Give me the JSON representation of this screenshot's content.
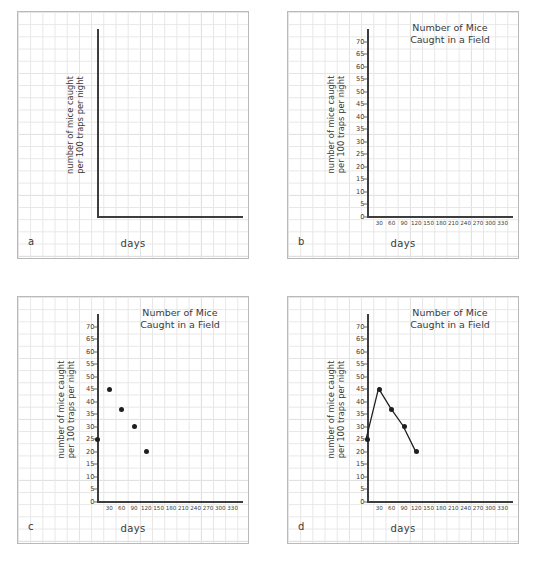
{
  "figure": {
    "panels": [
      {
        "letter": "a",
        "name": "panel-a",
        "title": "",
        "has_title": false,
        "has_ticks": false,
        "xlabel": "days",
        "ylabel": "number of mice caught\nper 100 traps per night",
        "plot_type": "axes-only"
      },
      {
        "letter": "b",
        "name": "panel-b",
        "title": "Number of Mice\nCaught in a Field",
        "has_title": true,
        "has_ticks": true,
        "xlabel": "days",
        "ylabel": "number of mice caught\nper 100 traps per night",
        "plot_type": "empty-axes-scaled"
      },
      {
        "letter": "c",
        "name": "panel-c",
        "title": "Number of Mice\nCaught in a Field",
        "has_title": true,
        "has_ticks": true,
        "xlabel": "days",
        "ylabel": "number of mice caught\nper 100 traps per night",
        "plot_type": "scatter"
      },
      {
        "letter": "d",
        "name": "panel-d",
        "title": "Number of Mice\nCaught in a Field",
        "has_title": true,
        "has_ticks": true,
        "xlabel": "days",
        "ylabel": "number of mice caught\nper 100 traps per night",
        "plot_type": "line"
      }
    ],
    "yticks": [
      0,
      5,
      10,
      15,
      20,
      25,
      30,
      35,
      40,
      45,
      50,
      55,
      60,
      65,
      70
    ],
    "xticks": [
      30,
      60,
      90,
      120,
      150,
      180,
      210,
      240,
      270,
      300,
      330
    ]
  },
  "chart_data": [
    {
      "type": "scatter",
      "panel": "c",
      "title": "Number of Mice Caught in a Field",
      "xlabel": "days",
      "ylabel": "number of mice caught per 100 traps per night",
      "x": [
        0,
        30,
        60,
        90,
        120
      ],
      "values": [
        25,
        45,
        37,
        30,
        20
      ],
      "xlim": [
        0,
        360
      ],
      "ylim": [
        0,
        75
      ],
      "xticks": [
        30,
        60,
        90,
        120,
        150,
        180,
        210,
        240,
        270,
        300,
        330
      ],
      "yticks": [
        0,
        5,
        10,
        15,
        20,
        25,
        30,
        35,
        40,
        45,
        50,
        55,
        60,
        65,
        70
      ],
      "grid": true,
      "legend": "none"
    },
    {
      "type": "line",
      "panel": "d",
      "title": "Number of Mice Caught in a Field",
      "xlabel": "days",
      "ylabel": "number of mice caught per 100 traps per night",
      "x": [
        0,
        30,
        60,
        90,
        120
      ],
      "values": [
        25,
        45,
        37,
        30,
        20
      ],
      "xlim": [
        0,
        360
      ],
      "ylim": [
        0,
        75
      ],
      "xticks": [
        30,
        60,
        90,
        120,
        150,
        180,
        210,
        240,
        270,
        300,
        330
      ],
      "yticks": [
        0,
        5,
        10,
        15,
        20,
        25,
        30,
        35,
        40,
        45,
        50,
        55,
        60,
        65,
        70
      ],
      "grid": true,
      "markers": true,
      "legend": "none"
    },
    {
      "type": "line",
      "panel": "b",
      "title": "Number of Mice Caught in a Field",
      "xlabel": "days",
      "ylabel": "number of mice caught per 100 traps per night",
      "x": [],
      "values": [],
      "xlim": [
        0,
        360
      ],
      "ylim": [
        0,
        75
      ],
      "xticks": [
        30,
        60,
        90,
        120,
        150,
        180,
        210,
        240,
        270,
        300,
        330
      ],
      "yticks": [
        0,
        5,
        10,
        15,
        20,
        25,
        30,
        35,
        40,
        45,
        50,
        55,
        60,
        65,
        70
      ],
      "grid": true,
      "legend": "none"
    },
    {
      "type": "line",
      "panel": "a",
      "title": "",
      "xlabel": "days",
      "ylabel": "number of mice caught per 100 traps per night",
      "x": [],
      "values": [],
      "xticks": [],
      "yticks": [],
      "grid": true,
      "legend": "none"
    }
  ],
  "colors": {
    "ink": "#3a3a3a",
    "axis": "#3d3d3d",
    "marker": "#1f1f1f",
    "grid_minor": "#e6e6e6",
    "grid_major": "#cfcfcf",
    "panel_border": "#b9b9b9",
    "paper": "#ffffff"
  }
}
